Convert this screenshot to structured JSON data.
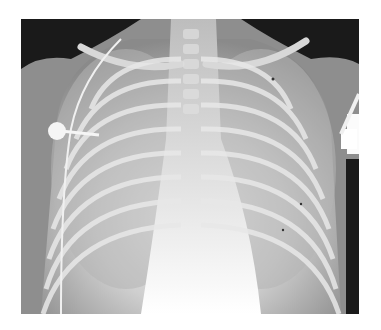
{
  "image": {
    "subject": "frontal chest radiograph",
    "description": "Infant chest X-ray showing rib cage, central mediastinum, clavicles, a catheter line on the right side, and ECG electrode clips at the shoulders",
    "colors": {
      "background": "#ffffff",
      "dark_air": "#1a1a1a",
      "soft_tissue": "#8c8c8c",
      "lung": "#a8a8a8",
      "bone": "#e6e6e6",
      "mediastinum": "#f4f4f4"
    }
  }
}
